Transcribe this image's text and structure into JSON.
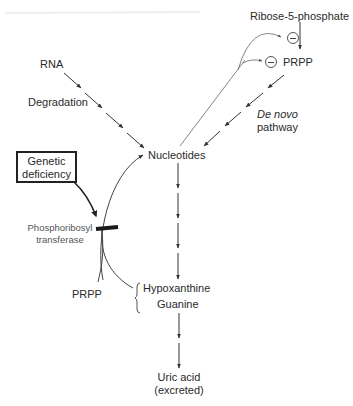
{
  "diagram": {
    "nodes": {
      "ribose5p": "Ribose-5-phosphate",
      "prpp_top": "PRPP",
      "rna": "RNA",
      "degradation": "Degradation",
      "de_novo_italic": "De novo",
      "de_novo_rest": "pathway",
      "nucleotides": "Nucleotides",
      "genetic_line1": "Genetic",
      "genetic_line2": "deficiency",
      "enzyme_line1": "Phosphoribosyl",
      "enzyme_line2": "transferase",
      "prpp_salvage": "PRPP",
      "hypoxanthine": "Hypoxanthine",
      "guanine": "Guanine",
      "uric_acid_line1": "Uric acid",
      "uric_acid_line2": "(excreted)"
    },
    "edges": [
      {
        "from": "Ribose-5-phosphate",
        "to": "PRPP",
        "type": "arrow"
      },
      {
        "from": "PRPP",
        "to": "Nucleotides",
        "type": "dashed-arrow",
        "label": "De novo pathway"
      },
      {
        "from": "RNA",
        "to": "Nucleotides",
        "type": "dashed-arrow",
        "label": "Degradation"
      },
      {
        "from": "Nucleotides",
        "to": "Ribose-5-phosphate→PRPP step",
        "type": "inhibition"
      },
      {
        "from": "Nucleotides",
        "to": "PRPP",
        "type": "inhibition"
      },
      {
        "from": "Nucleotides",
        "to": "Hypoxanthine / Guanine",
        "type": "dashed-arrow"
      },
      {
        "from": "Hypoxanthine / Guanine + PRPP",
        "to": "Nucleotides",
        "type": "salvage-arrow",
        "enzyme": "Phosphoribosyl transferase"
      },
      {
        "from": "Genetic deficiency",
        "to": "Phosphoribosyl transferase",
        "type": "block"
      },
      {
        "from": "Hypoxanthine / Guanine",
        "to": "Uric acid (excreted)",
        "type": "dashed-arrow"
      }
    ],
    "inhibitor_symbol": "⊖",
    "colors": {
      "line": "#3a3a3a",
      "text": "#2a2a2a",
      "block_bar": "#1a1a1a"
    }
  }
}
